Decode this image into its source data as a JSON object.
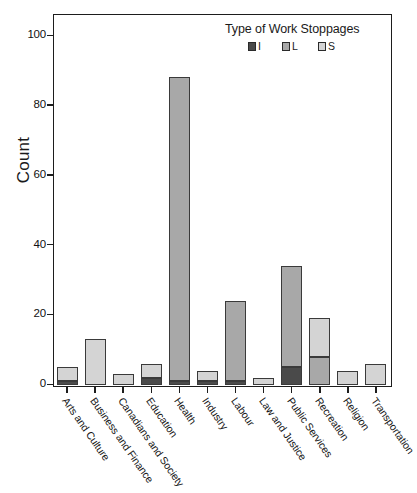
{
  "chart_data": {
    "type": "bar",
    "subtype": "stacked-bar",
    "title": "",
    "xlabel": "",
    "ylabel": "Count",
    "ylim": [
      0,
      105
    ],
    "yticks": [
      0,
      20,
      40,
      60,
      80,
      100
    ],
    "ytick_labels": [
      "0",
      "20",
      "40",
      "60",
      "80",
      "100"
    ],
    "grid": false,
    "legend": {
      "title": "Type of Work Stoppages",
      "position": "top-right",
      "entries": [
        {
          "label": "I",
          "color": "#4a4a4a"
        },
        {
          "label": "L",
          "color": "#a8a8a8"
        },
        {
          "label": "S",
          "color": "#d4d4d4"
        }
      ]
    },
    "categories": [
      "Arts and Culture",
      "Business and Finance",
      "Canadians and Society",
      "Education",
      "Health",
      "Industry",
      "Labour",
      "Law and Justice",
      "Public Services",
      "Recreation",
      "Religion",
      "Transportation"
    ],
    "series": [
      {
        "name": "I",
        "color": "#4a4a4a",
        "values": [
          1,
          0,
          0,
          2,
          1,
          1,
          1,
          0,
          5,
          0,
          0,
          0
        ]
      },
      {
        "name": "L",
        "color": "#a8a8a8",
        "values": [
          0,
          0,
          0,
          0,
          87,
          0,
          23,
          0,
          29,
          8,
          0,
          0
        ]
      },
      {
        "name": "S",
        "color": "#d4d4d4",
        "values": [
          4,
          13,
          3,
          4,
          0,
          3,
          0,
          2,
          0,
          11,
          4,
          6
        ]
      }
    ],
    "totals": [
      5,
      13,
      3,
      6,
      88,
      4,
      24,
      2,
      34,
      19,
      4,
      6
    ]
  },
  "axis": {
    "y_title": "Count"
  }
}
